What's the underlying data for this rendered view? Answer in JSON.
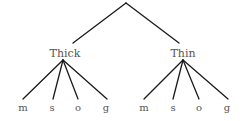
{
  "tree": {
    "root": {
      "label": "",
      "x": 126,
      "y": 3
    },
    "branches": [
      {
        "label": "Thick",
        "edge_end": {
          "x": 73,
          "y": 43
        },
        "label_pos": {
          "x": 65,
          "y": 48
        },
        "fan_origin": {
          "x": 63,
          "y": 60
        },
        "leaves": [
          {
            "label": "m",
            "x": 23
          },
          {
            "label": "s",
            "x": 52
          },
          {
            "label": "o",
            "x": 78
          },
          {
            "label": "g",
            "x": 106
          }
        ]
      },
      {
        "label": "Thin",
        "edge_end": {
          "x": 179,
          "y": 43
        },
        "label_pos": {
          "x": 183,
          "y": 48
        },
        "fan_origin": {
          "x": 183,
          "y": 60
        },
        "leaves": [
          {
            "label": "m",
            "x": 144
          },
          {
            "label": "s",
            "x": 173
          },
          {
            "label": "o",
            "x": 199
          },
          {
            "label": "g",
            "x": 227
          }
        ]
      }
    ],
    "leaf_line_end_y": 99,
    "leaf_label_y": 103,
    "colors": {
      "edge": "#1a1a1a",
      "text": "#555555"
    }
  }
}
